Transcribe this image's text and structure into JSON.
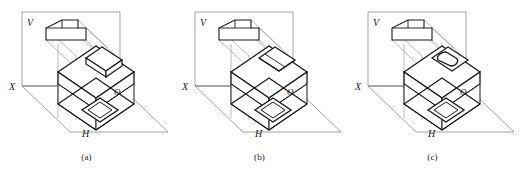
{
  "figure": {
    "panel_count": 3,
    "background_color": "#ffffff",
    "ink_color": "#1a1a1a",
    "construction_line_color": "#8c8c8c"
  },
  "labels": {
    "vertical_plane": "V",
    "horizontal_plane": "H",
    "x_axis": "X",
    "origin": "O"
  },
  "panels": [
    {
      "id": "panel-a",
      "caption": "(a)",
      "top_feature": "raised-rectangular-box",
      "feature_description": "small rectangular block protruding above the top face of the slab"
    },
    {
      "id": "panel-b",
      "caption": "(b)",
      "top_feature": "recessed-sloped-pocket",
      "feature_description": "angled pocket cut into the top face of the slab"
    },
    {
      "id": "panel-c",
      "caption": "(c)",
      "top_feature": "rounded-oblong-boss",
      "feature_description": "rounded oblong boss on the top face of the slab"
    }
  ]
}
